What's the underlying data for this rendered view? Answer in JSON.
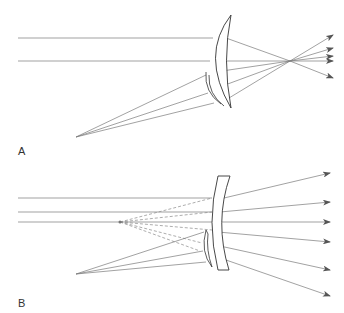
{
  "figure": {
    "colors": {
      "ray": "#7a7a7a",
      "lens_outline": "#333333",
      "arrow": "#555555",
      "label": "#333333",
      "background": "#ffffff"
    }
  },
  "panels": [
    {
      "id": "A",
      "label": "A",
      "lens_type": "plus meniscus with segment",
      "rays": "converge to focal point then diverge"
    },
    {
      "id": "B",
      "label": "B",
      "lens_type": "minus meniscus with segment",
      "rays": "diverge from virtual point (dashed)"
    }
  ]
}
